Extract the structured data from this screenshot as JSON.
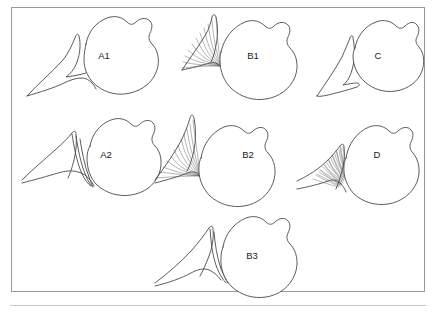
{
  "figure": {
    "frame": {
      "visible": true,
      "border_color": "#9a9a9a"
    },
    "bottom_rule": {
      "visible": true,
      "color": "#c8c8c8"
    },
    "line_color": "#4a4a4a",
    "fiber_color": "#555555",
    "background": "#ffffff",
    "panels": [
      {
        "id": "a1",
        "label": "A1",
        "row": 1,
        "column": 1,
        "label_x": 104,
        "label_y": 56,
        "fiber_style": "none",
        "fiber_count": 0,
        "description": "rounded body with smooth tapering attachment, no fibrous striation"
      },
      {
        "id": "b1",
        "label": "B1",
        "row": 1,
        "column": 2,
        "label_x": 253,
        "label_y": 56,
        "fiber_style": "fan",
        "fiber_count": 11,
        "description": "rounded body with fan of fibers converging at attachment point"
      },
      {
        "id": "c",
        "label": "C",
        "row": 1,
        "column": 3,
        "label_x": 378,
        "label_y": 56,
        "fiber_style": "detached",
        "fiber_count": 0,
        "description": "rounded body fully separated from pointed tapering structure"
      },
      {
        "id": "a2",
        "label": "A2",
        "row": 2,
        "column": 1,
        "label_x": 106,
        "label_y": 155,
        "fiber_style": "strands",
        "fiber_count": 3,
        "description": "rounded body with few narrow elongated strands at attachment"
      },
      {
        "id": "b2",
        "label": "B2",
        "row": 2,
        "column": 2,
        "label_x": 248,
        "label_y": 155,
        "fiber_style": "fan",
        "fiber_count": 12,
        "description": "rounded body with broad fan of fibers at attachment"
      },
      {
        "id": "d",
        "label": "D",
        "row": 2,
        "column": 3,
        "label_x": 377,
        "label_y": 155,
        "fiber_style": "dense-hatch",
        "fiber_count": 22,
        "description": "rounded body with dense hatched triangular fibrous mass"
      },
      {
        "id": "b3",
        "label": "B3",
        "row": 3,
        "column": 2,
        "label_x": 252,
        "label_y": 256,
        "fiber_style": "strands",
        "fiber_count": 2,
        "description": "rounded body with long slender attachment strands"
      }
    ]
  }
}
